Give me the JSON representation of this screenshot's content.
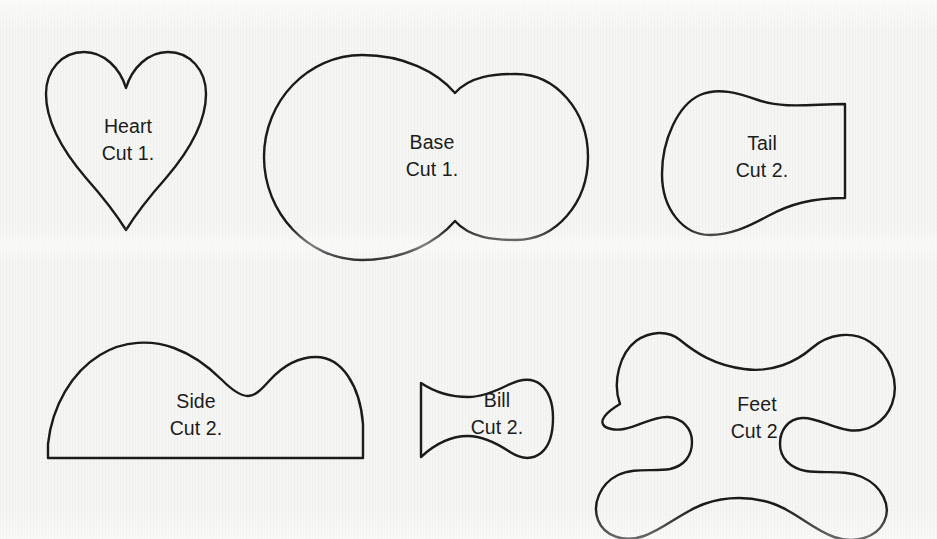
{
  "sheet": {
    "title": "Sewing Pattern Template Sheet",
    "background_color": "#f6f6f4",
    "stroke_color": "#1b1b1b",
    "text_color": "#1c1c1c",
    "width": 937,
    "height": 539
  },
  "pieces": [
    {
      "id": "heart",
      "name": "Heart",
      "cut": "Cut 1.",
      "shape": "heart",
      "label_x": 128,
      "label_y": 140,
      "bounds": {
        "x": 46,
        "y": 52,
        "width": 160,
        "height": 178
      }
    },
    {
      "id": "base",
      "name": "Base",
      "cut": "Cut 1.",
      "shape": "double-circle-peanut",
      "label_x": 432,
      "label_y": 156,
      "bounds": {
        "x": 264,
        "y": 55,
        "width": 324,
        "height": 205
      }
    },
    {
      "id": "tail",
      "name": "Tail",
      "cut": "Cut 2.",
      "shape": "tapered-blob-flat-right",
      "label_x": 762,
      "label_y": 157,
      "bounds": {
        "x": 662,
        "y": 90,
        "width": 183,
        "height": 145
      }
    },
    {
      "id": "side",
      "name": "Side",
      "cut": "Cut 2.",
      "shape": "two-hump-flat-bottom",
      "label_x": 196,
      "label_y": 415,
      "bounds": {
        "x": 48,
        "y": 340,
        "width": 315,
        "height": 118
      }
    },
    {
      "id": "bill",
      "name": "Bill",
      "cut": "Cut 2.",
      "shape": "tapered-blob-flat-left",
      "label_x": 497,
      "label_y": 414,
      "bounds": {
        "x": 421,
        "y": 380,
        "width": 132,
        "height": 80
      }
    },
    {
      "id": "feet",
      "name": "Feet",
      "cut": "Cut 2.",
      "shape": "bone",
      "label_x": 757,
      "label_y": 418,
      "bounds": {
        "x": 612,
        "y": 330,
        "width": 288,
        "height": 185
      }
    }
  ]
}
